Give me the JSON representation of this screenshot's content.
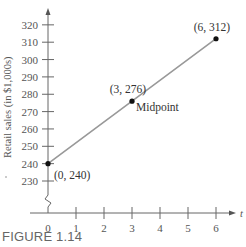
{
  "chart_data": {
    "type": "line",
    "title": "",
    "caption": "FIGURE 1.14",
    "xlabel": "t",
    "ylabel": "Retail sales (in $1,000s)",
    "x_ticks": [
      "0",
      "1",
      "2",
      "3",
      "4",
      "5",
      "6"
    ],
    "y_ticks": [
      "230",
      "240",
      "250",
      "260",
      "270",
      "280",
      "290",
      "300",
      "310",
      "320"
    ],
    "xlim": [
      0,
      6
    ],
    "ylim": [
      230,
      320
    ],
    "y_axis_break": true,
    "grid": false,
    "legend": null,
    "series": [
      {
        "name": "Retail sales",
        "x": [
          0,
          3,
          6
        ],
        "y": [
          240,
          276,
          312
        ],
        "color": "#999999"
      }
    ],
    "points": [
      {
        "x": 0,
        "y": 240,
        "label": "(0, 240)"
      },
      {
        "x": 3,
        "y": 276,
        "label": "(3, 276)",
        "annotation": "Midpoint"
      },
      {
        "x": 6,
        "y": 312,
        "label": "(6, 312)"
      }
    ]
  }
}
